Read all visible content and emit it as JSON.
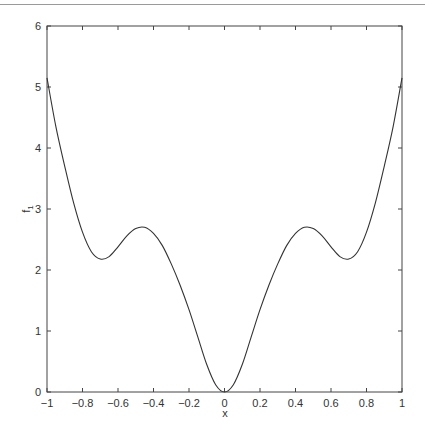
{
  "chart_data": {
    "type": "line",
    "title": "",
    "xlabel": "x",
    "ylabel": "f1",
    "ylabel_main": "f",
    "ylabel_sub": "1",
    "xlim": [
      -1,
      1
    ],
    "ylim": [
      0,
      6
    ],
    "grid": false,
    "legend": null,
    "x_ticks": [
      -1,
      -0.8,
      -0.6,
      -0.4,
      -0.2,
      0,
      0.2,
      0.4,
      0.6,
      0.8,
      1
    ],
    "x_tick_labels": [
      "-1",
      "-0.8",
      "-0.6",
      "-0.4",
      "-0.2",
      "0",
      "0.2",
      "0.4",
      "0.6",
      "0.8",
      "1"
    ],
    "y_ticks": [
      0,
      1,
      2,
      3,
      4,
      5,
      6
    ],
    "y_tick_labels": [
      "0",
      "1",
      "2",
      "3",
      "4",
      "5",
      "6"
    ],
    "series": [
      {
        "name": "f1",
        "color": "#333333",
        "x": [
          -1,
          -0.95,
          -0.9,
          -0.85,
          -0.8,
          -0.75,
          -0.7,
          -0.65,
          -0.6,
          -0.55,
          -0.5,
          -0.45,
          -0.4,
          -0.35,
          -0.3,
          -0.25,
          -0.2,
          -0.15,
          -0.1,
          -0.05,
          0,
          0.05,
          0.1,
          0.15,
          0.2,
          0.25,
          0.3,
          0.35,
          0.4,
          0.45,
          0.5,
          0.55,
          0.6,
          0.65,
          0.7,
          0.75,
          0.8,
          0.85,
          0.9,
          0.95,
          1
        ],
        "values": [
          5.15,
          4.35,
          3.7,
          3.1,
          2.62,
          2.3,
          2.18,
          2.22,
          2.38,
          2.56,
          2.68,
          2.7,
          2.6,
          2.4,
          2.1,
          1.75,
          1.35,
          0.9,
          0.45,
          0.12,
          0,
          0.12,
          0.45,
          0.9,
          1.35,
          1.75,
          2.1,
          2.4,
          2.6,
          2.7,
          2.68,
          2.56,
          2.38,
          2.22,
          2.18,
          2.3,
          2.62,
          3.1,
          3.7,
          4.35,
          5.15
        ]
      }
    ]
  }
}
